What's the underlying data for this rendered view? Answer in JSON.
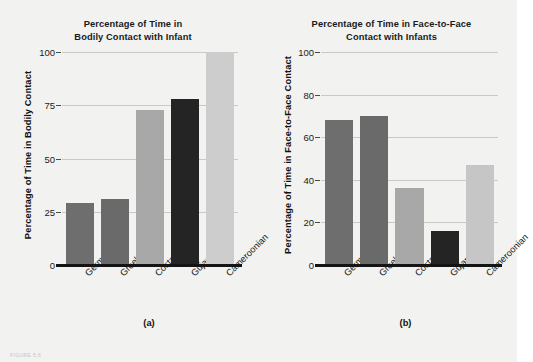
{
  "figure": {
    "background_color": "#f2f2f0",
    "caption_faint": "FIGURE 5.6"
  },
  "chart_data": [
    {
      "type": "bar",
      "panel": "(a)",
      "title": "Percentage of Time in Bodily Contact with Infant",
      "title_line1": "Percentage of Time in",
      "title_line2": "Bodily Contact with Infant",
      "xlabel": "",
      "ylabel": "Percentage of Time in Bodily Contact",
      "categories": [
        "German",
        "Greek",
        "Costa Rican",
        "Gujarati",
        "Cameroonian"
      ],
      "values": [
        29,
        31,
        73,
        78,
        100
      ],
      "ylim": [
        0,
        100
      ],
      "yticks": [
        0,
        25,
        50,
        75,
        100
      ],
      "ytick_labels": [
        "0",
        "25",
        "50",
        "75",
        "100"
      ],
      "grid": true,
      "legend": "none",
      "bar_colors": [
        "#6e6e6e",
        "#6a6a6a",
        "#a8a8a8",
        "#242424",
        "#cdcdcd"
      ]
    },
    {
      "type": "bar",
      "panel": "(b)",
      "title": "Percentage of Time in Face-to-Face Contact with Infants",
      "title_line1": "Percentage of Time in Face-to-Face",
      "title_line2": "Contact with Infants",
      "xlabel": "",
      "ylabel": "Percentage of Time in Face-to-Face Contact",
      "categories": [
        "German",
        "Greek",
        "Costa Rican",
        "Gujarati",
        "Cameroonian"
      ],
      "values": [
        68,
        70,
        36,
        16,
        47
      ],
      "ylim": [
        0,
        100
      ],
      "yticks": [
        0,
        20,
        40,
        60,
        80,
        100
      ],
      "ytick_labels": [
        "0",
        "20",
        "40",
        "60",
        "80",
        "100"
      ],
      "grid": true,
      "legend": "none",
      "bar_colors": [
        "#6e6e6e",
        "#6a6a6a",
        "#a8a8a8",
        "#242424",
        "#c6c6c6"
      ]
    }
  ]
}
